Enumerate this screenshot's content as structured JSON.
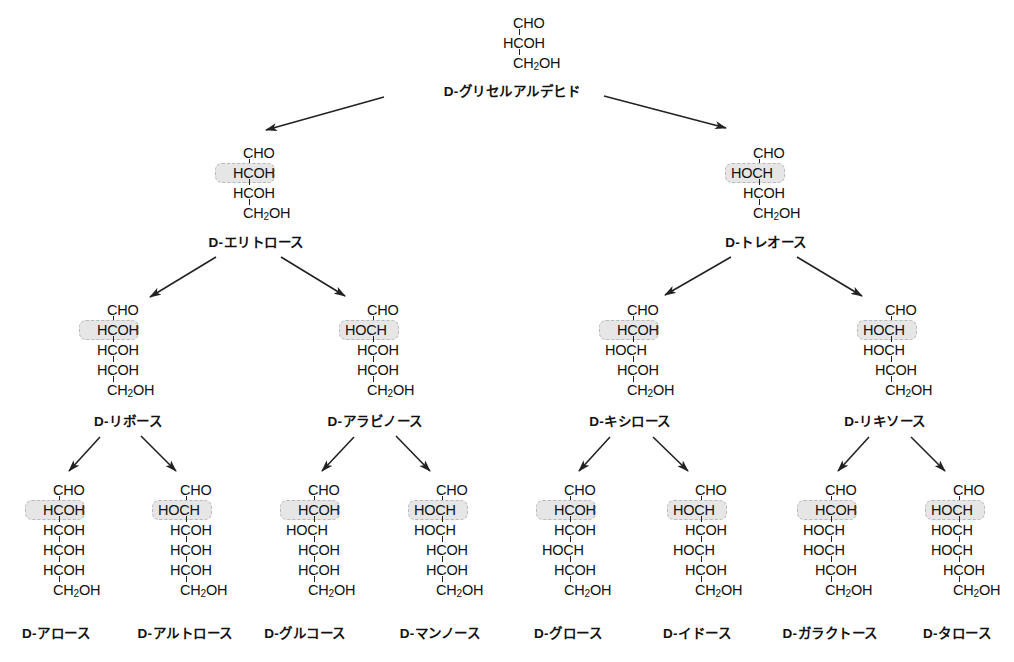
{
  "colors": {
    "text": "#111111",
    "highlight_fill": "#e6e6e6",
    "highlight_border": "#b9b9b9",
    "arrow": "#222222"
  },
  "nodes": [
    {
      "id": "glyceraldehyde",
      "name": "D-グリセルアルデヒド",
      "level": 0,
      "cx": 518,
      "top": 13,
      "rows": [
        "CHO",
        "HCOH",
        "CH2OH"
      ],
      "highlight_row": null,
      "label_y": 80
    },
    {
      "id": "erythrose",
      "name": "D-エリトロース",
      "level": 1,
      "cx": 248,
      "top": 143,
      "rows": [
        "CHO",
        "HCOH",
        "HCOH",
        "CH2OH"
      ],
      "highlight_row": 1,
      "label_y": 231
    },
    {
      "id": "threose",
      "name": "D-トレオース",
      "level": 1,
      "cx": 758,
      "top": 143,
      "rows": [
        "CHO",
        "HOCH",
        "HCOH",
        "CH2OH"
      ],
      "highlight_row": 1,
      "label_y": 231
    },
    {
      "id": "ribose",
      "name": "D-リボース",
      "level": 2,
      "cx": 112,
      "top": 300,
      "rows": [
        "CHO",
        "HCOH",
        "HCOH",
        "HCOH",
        "CH2OH"
      ],
      "highlight_row": 1,
      "label_y": 410
    },
    {
      "id": "arabinose",
      "name": "D-アラビノース",
      "level": 2,
      "cx": 372,
      "top": 300,
      "rows": [
        "CHO",
        "HOCH",
        "HCOH",
        "HCOH",
        "CH2OH"
      ],
      "highlight_row": 1,
      "label_y": 410
    },
    {
      "id": "xylose",
      "name": "D-キシロース",
      "level": 2,
      "cx": 632,
      "top": 300,
      "rows": [
        "CHO",
        "HCOH",
        "HOCH",
        "HCOH",
        "CH2OH"
      ],
      "highlight_row": 1,
      "label_y": 410
    },
    {
      "id": "lyxose",
      "name": "D-リキソース",
      "level": 2,
      "cx": 890,
      "top": 300,
      "rows": [
        "CHO",
        "HOCH",
        "HOCH",
        "HCOH",
        "CH2OH"
      ],
      "highlight_row": 1,
      "label_y": 410
    },
    {
      "id": "allose",
      "name": "D-アロース",
      "level": 3,
      "cx": 58,
      "top": 480,
      "rows": [
        "CHO",
        "HCOH",
        "HCOH",
        "HCOH",
        "HCOH",
        "CH2OH"
      ],
      "highlight_row": 1,
      "label_y": 622
    },
    {
      "id": "altrose",
      "name": "D-アルトロース",
      "level": 3,
      "cx": 185,
      "top": 480,
      "rows": [
        "CHO",
        "HOCH",
        "HCOH",
        "HCOH",
        "HCOH",
        "CH2OH"
      ],
      "highlight_row": 1,
      "label_y": 622
    },
    {
      "id": "glucose",
      "name": "D-グルコース",
      "level": 3,
      "cx": 313,
      "top": 480,
      "rows": [
        "CHO",
        "HCOH",
        "HOCH",
        "HCOH",
        "HCOH",
        "CH2OH"
      ],
      "highlight_row": 1,
      "label_y": 622
    },
    {
      "id": "mannose",
      "name": "D-マンノース",
      "level": 3,
      "cx": 441,
      "top": 480,
      "rows": [
        "CHO",
        "HOCH",
        "HOCH",
        "HCOH",
        "HCOH",
        "CH2OH"
      ],
      "highlight_row": 1,
      "label_y": 622
    },
    {
      "id": "gulose",
      "name": "D-グロース",
      "level": 3,
      "cx": 569,
      "top": 480,
      "rows": [
        "CHO",
        "HCOH",
        "HCOH",
        "HOCH",
        "HCOH",
        "CH2OH"
      ],
      "highlight_row": 1,
      "label_y": 622
    },
    {
      "id": "idose",
      "name": "D-イドース",
      "level": 3,
      "cx": 700,
      "top": 480,
      "rows": [
        "CHO",
        "HOCH",
        "HCOH",
        "HOCH",
        "HCOH",
        "CH2OH"
      ],
      "highlight_row": 1,
      "label_y": 622
    },
    {
      "id": "galactose",
      "name": "D-ガラクトース",
      "level": 3,
      "cx": 830,
      "top": 480,
      "rows": [
        "CHO",
        "HCOH",
        "HOCH",
        "HOCH",
        "HCOH",
        "CH2OH"
      ],
      "highlight_row": 1,
      "label_y": 622
    },
    {
      "id": "talose",
      "name": "D-タロース",
      "level": 3,
      "cx": 958,
      "top": 480,
      "rows": [
        "CHO",
        "HOCH",
        "HOCH",
        "HOCH",
        "HCOH",
        "CH2OH"
      ],
      "highlight_row": 1,
      "label_y": 622
    }
  ],
  "label_centers": {
    "glyceraldehyde": 512,
    "erythrose": 256,
    "threose": 766,
    "ribose": 128,
    "arabinose": 375,
    "xylose": 630,
    "lyxose": 885,
    "allose": 56,
    "altrose": 185,
    "glucose": 305,
    "mannose": 440,
    "gulose": 568,
    "idose": 697,
    "galactose": 830,
    "talose": 957
  },
  "arrows": [
    {
      "from": "glyceraldehyde",
      "to": "erythrose",
      "x1": 384,
      "y1": 97,
      "x2": 266,
      "y2": 130
    },
    {
      "from": "glyceraldehyde",
      "to": "threose",
      "x1": 604,
      "y1": 96,
      "x2": 726,
      "y2": 128
    },
    {
      "from": "erythrose",
      "to": "ribose",
      "x1": 216,
      "y1": 257,
      "x2": 150,
      "y2": 297
    },
    {
      "from": "erythrose",
      "to": "arabinose",
      "x1": 281,
      "y1": 257,
      "x2": 345,
      "y2": 296
    },
    {
      "from": "threose",
      "to": "xylose",
      "x1": 731,
      "y1": 257,
      "x2": 665,
      "y2": 295
    },
    {
      "from": "threose",
      "to": "lyxose",
      "x1": 797,
      "y1": 257,
      "x2": 862,
      "y2": 296
    },
    {
      "from": "ribose",
      "to": "allose",
      "x1": 100,
      "y1": 437,
      "x2": 69,
      "y2": 471
    },
    {
      "from": "ribose",
      "to": "altrose",
      "x1": 141,
      "y1": 436,
      "x2": 176,
      "y2": 471
    },
    {
      "from": "arabinose",
      "to": "glucose",
      "x1": 354,
      "y1": 437,
      "x2": 322,
      "y2": 471
    },
    {
      "from": "arabinose",
      "to": "mannose",
      "x1": 396,
      "y1": 436,
      "x2": 430,
      "y2": 471
    },
    {
      "from": "xylose",
      "to": "gulose",
      "x1": 610,
      "y1": 437,
      "x2": 579,
      "y2": 471
    },
    {
      "from": "xylose",
      "to": "idose",
      "x1": 653,
      "y1": 437,
      "x2": 688,
      "y2": 471
    },
    {
      "from": "lyxose",
      "to": "galactose",
      "x1": 869,
      "y1": 437,
      "x2": 838,
      "y2": 471
    },
    {
      "from": "lyxose",
      "to": "talose",
      "x1": 911,
      "y1": 437,
      "x2": 945,
      "y2": 471
    }
  ]
}
